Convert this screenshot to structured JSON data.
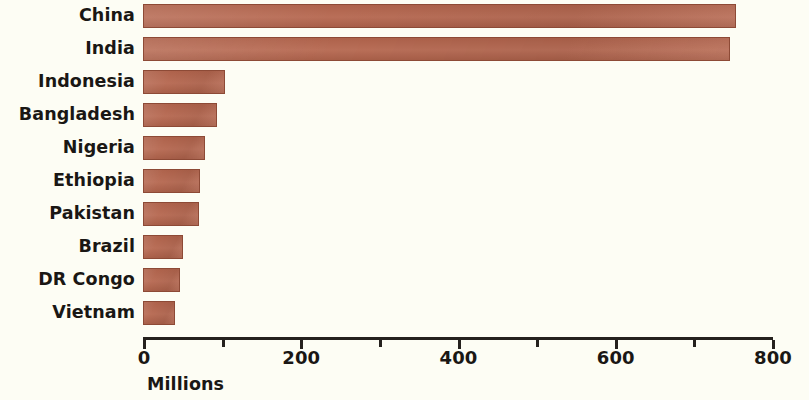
{
  "chart_data": {
    "type": "bar",
    "orientation": "horizontal",
    "title": "",
    "xlabel": "Millions",
    "ylabel": "",
    "xlim": [
      0,
      800
    ],
    "grid": false,
    "legend": null,
    "bar_color": "#b5664e",
    "background_color": "#fdfdf4",
    "text_color": "#1a1714",
    "x_ticks": [
      {
        "value": 0,
        "label": "0",
        "major": true
      },
      {
        "value": 100,
        "label": "",
        "major": false
      },
      {
        "value": 200,
        "label": "200",
        "major": true
      },
      {
        "value": 300,
        "label": "",
        "major": false
      },
      {
        "value": 400,
        "label": "400",
        "major": true
      },
      {
        "value": 500,
        "label": "",
        "major": false
      },
      {
        "value": 600,
        "label": "600",
        "major": true
      },
      {
        "value": 700,
        "label": "",
        "major": false
      },
      {
        "value": 800,
        "label": "800",
        "major": true
      }
    ],
    "categories": [
      "China",
      "India",
      "Indonesia",
      "Bangladesh",
      "Nigeria",
      "Ethiopia",
      "Pakistan",
      "Brazil",
      "DR Congo",
      "Vietnam"
    ],
    "values": [
      754,
      747,
      104,
      94,
      79,
      73,
      71,
      51,
      47,
      41
    ],
    "bars": [
      {
        "label": "China",
        "value": 754
      },
      {
        "label": "India",
        "value": 747
      },
      {
        "label": "Indonesia",
        "value": 104
      },
      {
        "label": "Bangladesh",
        "value": 94
      },
      {
        "label": "Nigeria",
        "value": 79
      },
      {
        "label": "Ethiopia",
        "value": 73
      },
      {
        "label": "Pakistan",
        "value": 71
      },
      {
        "label": "Brazil",
        "value": 51
      },
      {
        "label": "DR Congo",
        "value": 47
      },
      {
        "label": "Vietnam",
        "value": 41
      }
    ]
  }
}
